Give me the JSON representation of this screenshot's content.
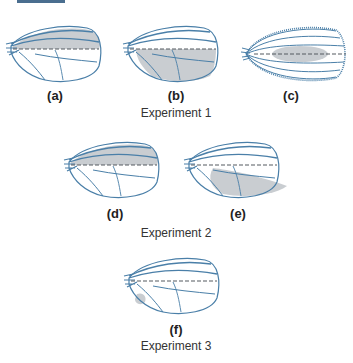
{
  "colors": {
    "vein": "#4a7fa8",
    "shade": "#c9cdd1",
    "midline": "#555a60",
    "label": "#222222",
    "topbar": "#4a6e8f"
  },
  "panels": [
    {
      "id": "a",
      "label": "(a)",
      "shading": "anterior"
    },
    {
      "id": "b",
      "label": "(b)",
      "shading": "posterior"
    },
    {
      "id": "c",
      "label": "(c)",
      "shading": "central-blob",
      "wing_type": "double-anterior"
    },
    {
      "id": "d",
      "label": "(d)",
      "shading": "anterior"
    },
    {
      "id": "e",
      "label": "(e)",
      "shading": "posterior-extended"
    },
    {
      "id": "f",
      "label": "(f)",
      "shading": "small-hinge-patch"
    }
  ],
  "experiments": [
    {
      "label": "Experiment 1",
      "panels": [
        "a",
        "b",
        "c"
      ]
    },
    {
      "label": "Experiment 2",
      "panels": [
        "d",
        "e"
      ]
    },
    {
      "label": "Experiment 3",
      "panels": [
        "f"
      ]
    }
  ]
}
